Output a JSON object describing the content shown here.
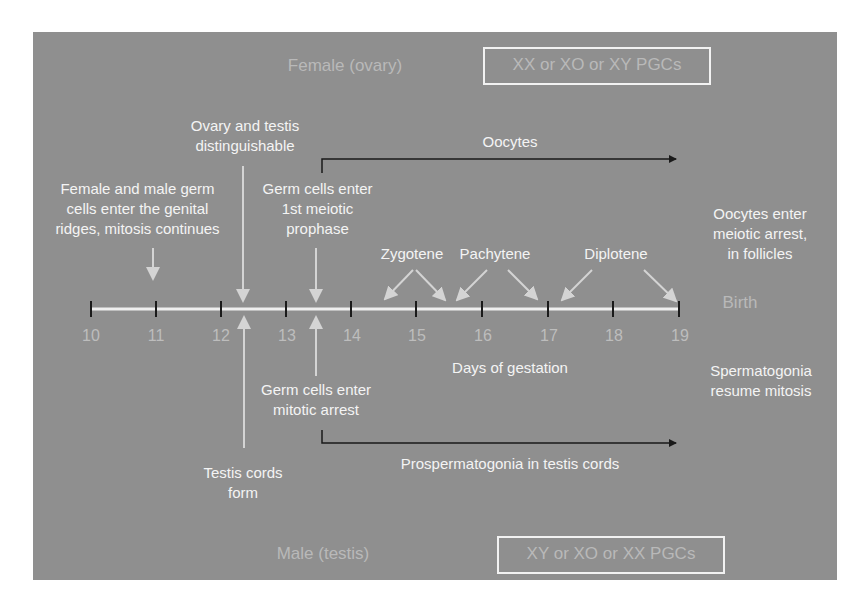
{
  "diagram": {
    "title_female": "Female (ovary)",
    "title_male": "Male (testis)",
    "female_pgc_box": "XX or XO or XY PGCs",
    "male_pgc_box": "XY or XO or XX PGCs",
    "axis": {
      "label": "Days of gestation",
      "ticks": [
        "10",
        "11",
        "12",
        "13",
        "14",
        "15",
        "16",
        "17",
        "18",
        "19"
      ],
      "end_label": "Birth"
    },
    "female_events": {
      "genital_ridges": [
        "Female and male germ",
        "cells enter the genital",
        "ridges, mitosis continues"
      ],
      "distinguishable": [
        "Ovary and testis",
        "distinguishable"
      ],
      "meiotic_prophase": [
        "Germ cells enter",
        "1st meiotic",
        "prophase"
      ],
      "oocytes": "Oocytes",
      "zygotene": "Zygotene",
      "pachytene": "Pachytene",
      "diplotene": "Diplotene",
      "meiotic_arrest": [
        "Oocytes enter",
        "meiotic arrest,",
        "in follicles"
      ]
    },
    "male_events": {
      "mitotic_arrest": [
        "Germ cells enter",
        "mitotic arrest"
      ],
      "testis_cords": [
        "Testis cords",
        "form"
      ],
      "prospermatogonia": "Prospermatogonia in testis cords",
      "resume_mitosis": [
        "Spermatogonia",
        "resume mitosis"
      ]
    },
    "colors": {
      "background": "#8f8f8f",
      "text": "#f4f4f4",
      "dim_text": "#b9b9b9",
      "bracket": "#1a1a1a",
      "pale_arrow": "#d4d4d4"
    }
  }
}
